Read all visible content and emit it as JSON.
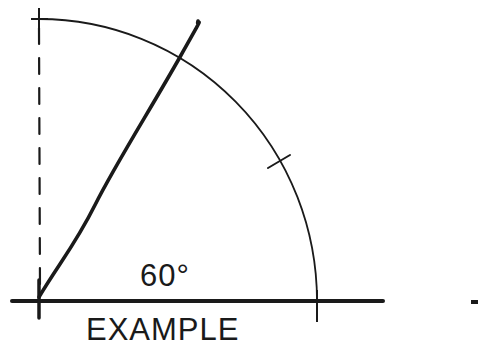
{
  "diagram": {
    "angle_label": "60°",
    "caption": "EXAMPLE",
    "angle_degrees": 60,
    "colors": {
      "ink": "#1a1a1a",
      "background": "#ffffff"
    },
    "elements": [
      "horizontal baseline",
      "dashed vertical reference line",
      "quarter-circle arc",
      "60-degree construction line",
      "tick mark at arc midpoint (45°)",
      "tick mark at arc top (90°)",
      "tick mark at baseline-arc intersection (0°)"
    ]
  }
}
